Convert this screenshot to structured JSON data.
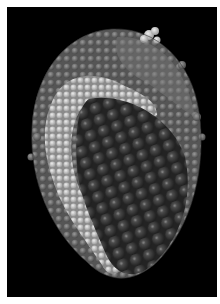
{
  "image": {
    "subject": "molecular surface rendering of a particle with outer shell cut away to reveal inner core spheres",
    "background_color": "#000000",
    "border_color": "#ffffff",
    "palette": {
      "outer_shell": "#6e6e6e",
      "outer_shell_light": "#8c8c8c",
      "highlight_band": "#cfcfcf",
      "inner_core": "#3a3a3a",
      "core_sphere_highlight": "#9a9a9a"
    }
  }
}
